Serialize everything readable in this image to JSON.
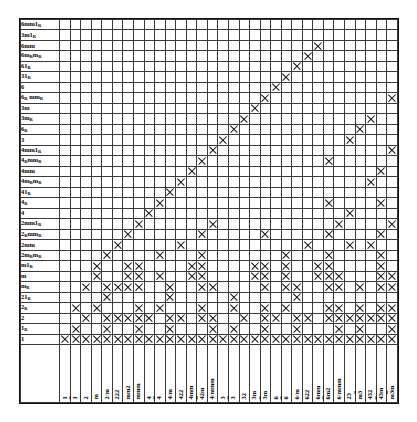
{
  "figure": {
    "kind": "subgroup-relation-table",
    "mark_glyph": "x-mark",
    "grid_color": "#3a3a3a",
    "frame_color": "#111111",
    "background": "#ffffff"
  },
  "chart_data": {
    "type": "table",
    "title": "",
    "xlabel": "",
    "ylabel": "",
    "grid": true,
    "legend": "none",
    "column_headers": [
      "1",
      "1̅",
      "2",
      "m",
      "2/m",
      "222",
      "mm2",
      "mmm",
      "4",
      "4̅",
      "4/m",
      "422",
      "4mm",
      "4̅2m",
      "4/mmm",
      "3",
      "3̅",
      "32",
      "3m",
      "3̅m",
      "6",
      "6̅",
      "6/m",
      "622",
      "6mm",
      "6̅m2",
      "6/mmm",
      "23",
      "m3̅",
      "432",
      "4̅3m",
      "m3̅m"
    ],
    "row_headers": [
      "6mm1R",
      "3m1R",
      "6mm",
      "6mRmR",
      "61R",
      "31R",
      "6",
      "6R mmR",
      "3m",
      "3mR",
      "6R",
      "3",
      "4mm1R",
      "4RmmR",
      "4mm",
      "4mRmR",
      "41R",
      "4R",
      "4",
      "2mm1R",
      "2RmmR",
      "2mm",
      "2mRmR",
      "m1R",
      "m",
      "mR",
      "21R",
      "2R",
      "2",
      "1R",
      "1"
    ],
    "row_headers_display": [
      {
        "base": "6mm1",
        "sub": "R"
      },
      {
        "base": "3m1",
        "sub": "R"
      },
      {
        "base": "6mm",
        "sub": ""
      },
      {
        "base": "6m",
        "sub": "R",
        "base2": "m",
        "sub2": "R"
      },
      {
        "base": "61",
        "sub": "R"
      },
      {
        "base": "31",
        "sub": "R"
      },
      {
        "base": "6",
        "sub": ""
      },
      {
        "base": "6",
        "sub": "R",
        "base2": " mm",
        "sub2": "R"
      },
      {
        "base": "3m",
        "sub": ""
      },
      {
        "base": "3m",
        "sub": "R"
      },
      {
        "base": "6",
        "sub": "R"
      },
      {
        "base": "3",
        "sub": ""
      },
      {
        "base": "4mm1",
        "sub": "R"
      },
      {
        "base": "4",
        "sub": "R",
        "base2": "mm",
        "sub2": "R"
      },
      {
        "base": "4mm",
        "sub": ""
      },
      {
        "base": "4m",
        "sub": "R",
        "base2": "m",
        "sub2": "R"
      },
      {
        "base": "41",
        "sub": "R"
      },
      {
        "base": "4",
        "sub": "R"
      },
      {
        "base": "4",
        "sub": ""
      },
      {
        "base": "2mm1",
        "sub": "R"
      },
      {
        "base": "2",
        "sub": "R",
        "base2": "mm",
        "sub2": "R"
      },
      {
        "base": "2mm",
        "sub": ""
      },
      {
        "base": "2m",
        "sub": "R",
        "base2": "m",
        "sub2": "R"
      },
      {
        "base": "m1",
        "sub": "R"
      },
      {
        "base": "m",
        "sub": ""
      },
      {
        "base": "m",
        "sub": "R"
      },
      {
        "base": "21",
        "sub": "R"
      },
      {
        "base": "2",
        "sub": "R"
      },
      {
        "base": "2",
        "sub": ""
      },
      {
        "base": "1",
        "sub": "R"
      },
      {
        "base": "1",
        "sub": ""
      }
    ],
    "column_headers_display": [
      {
        "t": "1",
        "ovl": false
      },
      {
        "t": "1",
        "ovl": true
      },
      {
        "t": "2",
        "ovl": false
      },
      {
        "t": "m",
        "ovl": false
      },
      {
        "t": "2/m",
        "ovl": false
      },
      {
        "t": "222",
        "ovl": false
      },
      {
        "t": "mm2",
        "ovl": false
      },
      {
        "t": "mmm",
        "ovl": false
      },
      {
        "t": "4",
        "ovl": false
      },
      {
        "t": "4",
        "ovl": true
      },
      {
        "t": "4/m",
        "ovl": false
      },
      {
        "t": "422",
        "ovl": false
      },
      {
        "t": "4mm",
        "ovl": false
      },
      {
        "t": "42m",
        "ovl": "first"
      },
      {
        "t": "4/mmm",
        "ovl": false
      },
      {
        "t": "3",
        "ovl": false
      },
      {
        "t": "3",
        "ovl": true
      },
      {
        "t": "32",
        "ovl": false
      },
      {
        "t": "3m",
        "ovl": false
      },
      {
        "t": "3m",
        "ovl": "first"
      },
      {
        "t": "6",
        "ovl": false
      },
      {
        "t": "6",
        "ovl": true
      },
      {
        "t": "6/m",
        "ovl": false
      },
      {
        "t": "622",
        "ovl": false
      },
      {
        "t": "6mm",
        "ovl": false
      },
      {
        "t": "6m2",
        "ovl": "first"
      },
      {
        "t": "6/mmm",
        "ovl": false
      },
      {
        "t": "23",
        "ovl": false
      },
      {
        "t": "m3",
        "ovl": "last"
      },
      {
        "t": "432",
        "ovl": false
      },
      {
        "t": "43m",
        "ovl": "first"
      },
      {
        "t": "m3m",
        "ovl": "mid"
      }
    ],
    "n_rows": 31,
    "n_cols": 32,
    "marks": [
      [
        0,
        0,
        0,
        0,
        0,
        0,
        0,
        0,
        0,
        0,
        0,
        0,
        0,
        0,
        0,
        0,
        0,
        0,
        0,
        0,
        0,
        0,
        0,
        0,
        0,
        0,
        0,
        0,
        0,
        0,
        0,
        0
      ],
      [
        0,
        0,
        0,
        0,
        0,
        0,
        0,
        0,
        0,
        0,
        0,
        0,
        0,
        0,
        0,
        0,
        0,
        0,
        0,
        0,
        0,
        0,
        0,
        0,
        0,
        0,
        0,
        0,
        0,
        0,
        0,
        0
      ],
      [
        0,
        0,
        0,
        0,
        0,
        0,
        0,
        0,
        0,
        0,
        0,
        0,
        0,
        0,
        0,
        0,
        0,
        0,
        0,
        0,
        0,
        0,
        0,
        0,
        1,
        0,
        0,
        0,
        0,
        0,
        0,
        0
      ],
      [
        0,
        0,
        0,
        0,
        0,
        0,
        0,
        0,
        0,
        0,
        0,
        0,
        0,
        0,
        0,
        0,
        0,
        0,
        0,
        0,
        0,
        0,
        0,
        1,
        0,
        0,
        0,
        0,
        0,
        0,
        0,
        0
      ],
      [
        0,
        0,
        0,
        0,
        0,
        0,
        0,
        0,
        0,
        0,
        0,
        0,
        0,
        0,
        0,
        0,
        0,
        0,
        0,
        0,
        0,
        0,
        1,
        0,
        0,
        0,
        0,
        0,
        0,
        0,
        0,
        0
      ],
      [
        0,
        0,
        0,
        0,
        0,
        0,
        0,
        0,
        0,
        0,
        0,
        0,
        0,
        0,
        0,
        0,
        0,
        0,
        0,
        0,
        0,
        1,
        0,
        0,
        0,
        0,
        0,
        0,
        0,
        0,
        0,
        0
      ],
      [
        0,
        0,
        0,
        0,
        0,
        0,
        0,
        0,
        0,
        0,
        0,
        0,
        0,
        0,
        0,
        0,
        0,
        0,
        0,
        0,
        1,
        0,
        0,
        0,
        0,
        0,
        0,
        0,
        0,
        0,
        0,
        0
      ],
      [
        0,
        0,
        0,
        0,
        0,
        0,
        0,
        0,
        0,
        0,
        0,
        0,
        0,
        0,
        0,
        0,
        0,
        0,
        0,
        1,
        0,
        0,
        0,
        0,
        0,
        0,
        0,
        0,
        0,
        0,
        0,
        1
      ],
      [
        0,
        0,
        0,
        0,
        0,
        0,
        0,
        0,
        0,
        0,
        0,
        0,
        0,
        0,
        0,
        0,
        0,
        0,
        1,
        0,
        0,
        0,
        0,
        0,
        0,
        0,
        0,
        0,
        0,
        0,
        0,
        0
      ],
      [
        0,
        0,
        0,
        0,
        0,
        0,
        0,
        0,
        0,
        0,
        0,
        0,
        0,
        0,
        0,
        0,
        0,
        1,
        0,
        0,
        0,
        0,
        0,
        0,
        0,
        0,
        0,
        0,
        0,
        1,
        0,
        0
      ],
      [
        0,
        0,
        0,
        0,
        0,
        0,
        0,
        0,
        0,
        0,
        0,
        0,
        0,
        0,
        0,
        0,
        1,
        0,
        0,
        0,
        0,
        0,
        0,
        0,
        0,
        0,
        0,
        0,
        1,
        0,
        0,
        0
      ],
      [
        0,
        0,
        0,
        0,
        0,
        0,
        0,
        0,
        0,
        0,
        0,
        0,
        0,
        0,
        0,
        1,
        0,
        0,
        0,
        0,
        0,
        0,
        0,
        0,
        0,
        0,
        0,
        1,
        0,
        0,
        0,
        0
      ],
      [
        0,
        0,
        0,
        0,
        0,
        0,
        0,
        0,
        0,
        0,
        0,
        0,
        0,
        0,
        1,
        0,
        0,
        0,
        0,
        0,
        0,
        0,
        0,
        0,
        0,
        0,
        0,
        0,
        0,
        0,
        0,
        1
      ],
      [
        0,
        0,
        0,
        0,
        0,
        0,
        0,
        0,
        0,
        0,
        0,
        0,
        0,
        1,
        0,
        0,
        0,
        0,
        0,
        0,
        0,
        0,
        0,
        0,
        0,
        1,
        0,
        0,
        0,
        0,
        0,
        0
      ],
      [
        0,
        0,
        0,
        0,
        0,
        0,
        0,
        0,
        0,
        0,
        0,
        0,
        1,
        0,
        0,
        0,
        0,
        0,
        0,
        0,
        0,
        0,
        0,
        0,
        0,
        0,
        0,
        0,
        0,
        0,
        1,
        0
      ],
      [
        0,
        0,
        0,
        0,
        0,
        0,
        0,
        0,
        0,
        0,
        0,
        1,
        0,
        0,
        0,
        0,
        0,
        0,
        0,
        0,
        0,
        0,
        0,
        0,
        0,
        0,
        0,
        0,
        0,
        1,
        0,
        0
      ],
      [
        0,
        0,
        0,
        0,
        0,
        0,
        0,
        0,
        0,
        0,
        1,
        0,
        0,
        0,
        0,
        0,
        0,
        0,
        0,
        0,
        0,
        0,
        0,
        0,
        0,
        0,
        0,
        0,
        0,
        0,
        0,
        0
      ],
      [
        0,
        0,
        0,
        0,
        0,
        0,
        0,
        0,
        0,
        1,
        0,
        0,
        0,
        0,
        0,
        0,
        0,
        0,
        0,
        0,
        0,
        0,
        0,
        0,
        0,
        1,
        0,
        0,
        0,
        0,
        1,
        0
      ],
      [
        0,
        0,
        0,
        0,
        0,
        0,
        0,
        0,
        1,
        0,
        0,
        0,
        0,
        0,
        0,
        0,
        0,
        0,
        0,
        0,
        0,
        0,
        0,
        0,
        0,
        0,
        0,
        1,
        0,
        0,
        0,
        0
      ],
      [
        0,
        0,
        0,
        0,
        0,
        0,
        0,
        1,
        0,
        0,
        0,
        0,
        0,
        0,
        1,
        0,
        0,
        0,
        0,
        0,
        0,
        0,
        0,
        0,
        0,
        0,
        1,
        0,
        0,
        0,
        0,
        1
      ],
      [
        0,
        0,
        0,
        0,
        0,
        0,
        1,
        0,
        0,
        0,
        0,
        0,
        0,
        1,
        0,
        0,
        0,
        0,
        0,
        1,
        0,
        0,
        0,
        0,
        0,
        1,
        0,
        0,
        0,
        0,
        1,
        0
      ],
      [
        0,
        0,
        0,
        0,
        0,
        1,
        0,
        0,
        0,
        0,
        0,
        1,
        0,
        0,
        0,
        0,
        0,
        0,
        0,
        0,
        0,
        0,
        0,
        1,
        0,
        0,
        0,
        1,
        0,
        1,
        0,
        0
      ],
      [
        0,
        0,
        0,
        0,
        1,
        0,
        0,
        0,
        0,
        1,
        0,
        0,
        0,
        1,
        0,
        0,
        0,
        0,
        0,
        0,
        0,
        1,
        0,
        0,
        0,
        1,
        0,
        0,
        0,
        0,
        1,
        0
      ],
      [
        0,
        0,
        0,
        1,
        0,
        0,
        1,
        1,
        0,
        0,
        0,
        0,
        1,
        1,
        0,
        0,
        0,
        0,
        1,
        1,
        0,
        1,
        0,
        0,
        1,
        1,
        0,
        0,
        0,
        0,
        1,
        0
      ],
      [
        0,
        0,
        0,
        1,
        0,
        0,
        1,
        1,
        0,
        1,
        0,
        0,
        1,
        1,
        0,
        0,
        0,
        0,
        1,
        1,
        0,
        1,
        0,
        0,
        1,
        1,
        1,
        0,
        0,
        0,
        1,
        1
      ],
      [
        0,
        0,
        1,
        0,
        1,
        1,
        1,
        1,
        0,
        0,
        1,
        0,
        0,
        1,
        1,
        0,
        0,
        0,
        0,
        1,
        0,
        1,
        1,
        0,
        0,
        1,
        1,
        0,
        1,
        0,
        1,
        1
      ],
      [
        0,
        0,
        0,
        0,
        1,
        0,
        0,
        0,
        0,
        0,
        1,
        0,
        0,
        0,
        0,
        0,
        1,
        0,
        0,
        0,
        0,
        0,
        1,
        0,
        0,
        0,
        0,
        0,
        0,
        0,
        0,
        0
      ],
      [
        0,
        1,
        0,
        1,
        0,
        0,
        0,
        1,
        0,
        1,
        0,
        0,
        0,
        1,
        0,
        0,
        1,
        0,
        0,
        1,
        0,
        1,
        0,
        0,
        0,
        1,
        1,
        0,
        1,
        0,
        1,
        1
      ],
      [
        0,
        0,
        1,
        0,
        1,
        1,
        1,
        1,
        1,
        0,
        1,
        1,
        0,
        1,
        1,
        0,
        0,
        1,
        0,
        1,
        1,
        0,
        1,
        1,
        0,
        1,
        1,
        1,
        1,
        1,
        1,
        1
      ],
      [
        0,
        1,
        0,
        0,
        1,
        0,
        0,
        1,
        0,
        0,
        1,
        0,
        0,
        0,
        1,
        0,
        1,
        0,
        0,
        1,
        0,
        0,
        1,
        0,
        0,
        0,
        1,
        0,
        1,
        0,
        0,
        1
      ],
      [
        1,
        1,
        1,
        1,
        1,
        1,
        1,
        1,
        1,
        1,
        1,
        1,
        1,
        1,
        1,
        1,
        1,
        1,
        1,
        1,
        1,
        1,
        1,
        1,
        1,
        1,
        1,
        1,
        1,
        1,
        1,
        1
      ]
    ]
  }
}
